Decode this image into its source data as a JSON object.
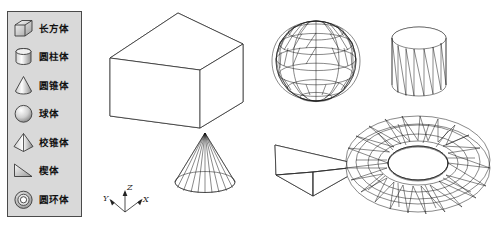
{
  "page": {
    "top_fragment": "",
    "background_color": "#ffffff"
  },
  "legend": {
    "name": "solid-primitives-palette",
    "panel_color": "#d9d9d9",
    "border_color": "#4a4a4a",
    "items": [
      {
        "icon": "cuboid-icon",
        "label": "长方体"
      },
      {
        "icon": "cylinder-icon",
        "label": "圆柱体"
      },
      {
        "icon": "cone-icon",
        "label": "圆锥体"
      },
      {
        "icon": "sphere-icon",
        "label": "球体"
      },
      {
        "icon": "pyramid-icon",
        "label": "校锥体"
      },
      {
        "icon": "wedge-icon",
        "label": "楔体"
      },
      {
        "icon": "torus-icon",
        "label": "圆环体"
      }
    ]
  },
  "viewport": {
    "name": "3d-model-viewport",
    "shapes": [
      {
        "id": "cuboid",
        "name": "长方体",
        "render": "wireframe-box"
      },
      {
        "id": "sphere",
        "name": "球体",
        "render": "triangulated-mesh"
      },
      {
        "id": "cylinder",
        "name": "圆柱体",
        "render": "faceted-wireframe"
      },
      {
        "id": "cone",
        "name": "圆锥体",
        "render": "radial-wireframe"
      },
      {
        "id": "wedge",
        "name": "楔体",
        "render": "wireframe-prism"
      },
      {
        "id": "torus",
        "name": "圆环体",
        "render": "triangulated-mesh"
      }
    ],
    "axis_gizmo": {
      "name": "ucs-axis-indicator",
      "x_label": "X",
      "y_label": "Y",
      "z_label": "Z"
    }
  }
}
